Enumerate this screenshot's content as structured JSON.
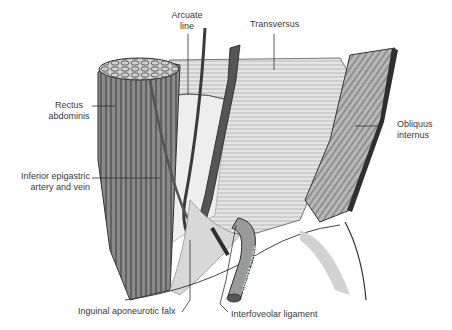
{
  "figure": {
    "style": "grayscale anatomical engraving",
    "background": "#ffffff",
    "ink": "#3a3a3a"
  },
  "labels": [
    {
      "id": "arcuate-line",
      "lines": [
        "Arcuate",
        "line"
      ],
      "x": 186,
      "y": 10,
      "align": "center",
      "pointer": [
        [
          188,
          34
        ],
        [
          188,
          95
        ]
      ]
    },
    {
      "id": "transversus",
      "lines": [
        "Transversus"
      ],
      "x": 250,
      "y": 19,
      "align": "left",
      "pointer": [
        [
          274,
          34
        ],
        [
          274,
          70
        ]
      ]
    },
    {
      "id": "rectus-abdominis",
      "lines": [
        "Rectus",
        "abdominis"
      ],
      "x": 48,
      "y": 100,
      "align": "center",
      "pointer": [
        [
          92,
          106
        ],
        [
          115,
          106
        ]
      ]
    },
    {
      "id": "obliquus-internus",
      "lines": [
        "Obliquus",
        "internus"
      ],
      "x": 396,
      "y": 119,
      "align": "left",
      "pointer": [
        [
          380,
          126
        ],
        [
          355,
          126
        ]
      ]
    },
    {
      "id": "inferior-epigastric",
      "lines": [
        "Inferior epigastric",
        "artery and vein"
      ],
      "x": 10,
      "y": 172,
      "align": "right",
      "pointer": [
        [
          92,
          178
        ],
        [
          160,
          178
        ]
      ]
    },
    {
      "id": "inguinal-falx",
      "lines": [
        "Inguinal aponeurotic falx"
      ],
      "x": 78,
      "y": 305,
      "align": "left",
      "pointer": [
        [
          182,
          312
        ],
        [
          190,
          300
        ],
        [
          190,
          240
        ]
      ]
    },
    {
      "id": "interfoveolar-ligament",
      "lines": [
        "Interfoveolar ligament"
      ],
      "x": 231,
      "y": 309,
      "align": "left",
      "pointer": [
        [
          228,
          312
        ],
        [
          220,
          304
        ],
        [
          226,
          280
        ],
        [
          236,
          225
        ]
      ]
    }
  ],
  "structures": {
    "sperm_cord_text": "SPERM.CORD"
  }
}
